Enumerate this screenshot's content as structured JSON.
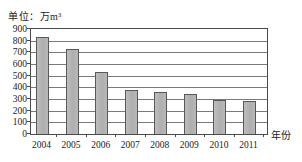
{
  "chart": {
    "unit_label": "单位：万m³",
    "xaxis_title": "年份"
  },
  "chart_data": {
    "type": "bar",
    "title": "单位：万m³",
    "xlabel": "年份",
    "ylabel": "",
    "categories": [
      "2004",
      "2005",
      "2006",
      "2007",
      "2008",
      "2009",
      "2010",
      "2011"
    ],
    "values": [
      830,
      725,
      530,
      375,
      360,
      340,
      290,
      285
    ],
    "ylim": [
      0,
      900
    ],
    "yticks": [
      0,
      100,
      200,
      300,
      400,
      500,
      600,
      700,
      800,
      900
    ],
    "grid": true,
    "legend": "none",
    "bar_color": "#b4b4b4",
    "bar_border_color": "#585858",
    "gridline_color": "#7a7a7a",
    "axis_color": "#4a4a4a",
    "text_color": "#1c1c1c"
  }
}
